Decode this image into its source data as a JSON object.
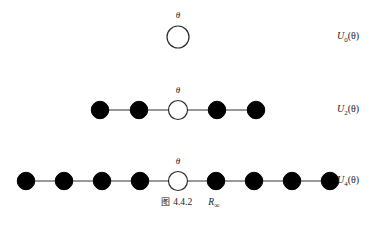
{
  "figure": {
    "caption_prefix": "图",
    "caption_number": "4.4.2",
    "caption_symbol": "R",
    "caption_symbol_subscript": "∞",
    "background_color": "#ffffff",
    "node_filled_color": "#000000",
    "node_open_color": "#ffffff",
    "edge_color": "#333333",
    "text_color": "#222222"
  },
  "chart_data": {
    "type": "diagram",
    "rows": [
      {
        "id": "row-u0",
        "label_base": "U",
        "label_subscript": "0",
        "label_arg": "(θ)",
        "label_full": "U₀(θ)",
        "center_theta": "θ",
        "total_nodes": 1,
        "filled_left": 0,
        "filled_right": 0,
        "open_center": 1,
        "edges": 0,
        "center_x": 178,
        "center_y": 37,
        "spacing": 39,
        "node_radius": 11,
        "theta_x": 168,
        "theta_y": 11,
        "label_x": 337,
        "label_y": 31
      },
      {
        "id": "row-u2",
        "label_base": "U",
        "label_subscript": "2",
        "label_arg": "(θ)",
        "label_full": "U₂(θ)",
        "center_theta": "θ",
        "total_nodes": 5,
        "filled_left": 2,
        "filled_right": 2,
        "open_center": 1,
        "edges": 4,
        "center_x": 178,
        "center_y": 110,
        "spacing": 39,
        "node_radius": 9.5,
        "theta_x": 168,
        "theta_y": 86,
        "label_x": 337,
        "label_y": 104
      },
      {
        "id": "row-u4",
        "label_base": "U",
        "label_subscript": "4",
        "label_arg": "(θ)",
        "label_full": "U₄(θ)",
        "center_theta": "θ",
        "total_nodes": 9,
        "filled_left": 4,
        "filled_right": 4,
        "open_center": 1,
        "edges": 8,
        "center_x": 178,
        "center_y": 181,
        "spacing": 38,
        "node_radius": 9.5,
        "theta_x": 168,
        "theta_y": 157,
        "label_x": 337,
        "label_y": 175
      }
    ]
  }
}
